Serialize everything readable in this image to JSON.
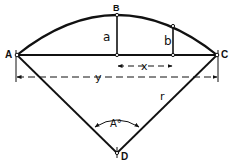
{
  "diagram": {
    "points": {
      "A": {
        "label": "A"
      },
      "B": {
        "label": "B"
      },
      "C": {
        "label": "C"
      },
      "D": {
        "label": "D"
      }
    },
    "variables": {
      "a": "a",
      "b": "b",
      "x": "x",
      "y": "y",
      "r": "r",
      "angle": "A°"
    },
    "colors": {
      "line": "#111111",
      "background": "#ffffff"
    }
  }
}
